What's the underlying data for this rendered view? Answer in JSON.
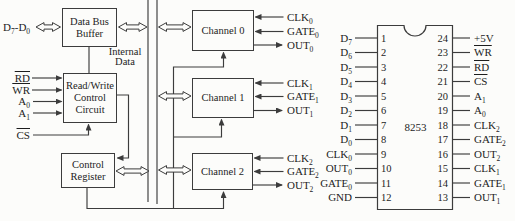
{
  "block_diagram": {
    "data_bus_label": [
      {
        "text": "D",
        "sub": "7"
      },
      {
        "text": "-"
      },
      {
        "text": "D",
        "sub": "0"
      }
    ],
    "control_signals": [
      [
        {
          "text": "RD",
          "overline": true
        }
      ],
      [
        {
          "text": "WR",
          "overline": true
        }
      ],
      [
        {
          "text": "A",
          "sub": "0"
        }
      ],
      [
        {
          "text": "A",
          "sub": "1"
        }
      ]
    ],
    "chip_select": [
      {
        "text": "CS",
        "overline": true
      }
    ],
    "blocks": {
      "data_bus_buffer": "Data Bus Buffer",
      "read_write_control": "Read/Write Control Circuit",
      "control_register": "Control Register"
    },
    "internal_bus_label": "Internal Data",
    "channels": [
      {
        "name": "Channel 0",
        "signals": [
          {
            "dir": "in",
            "label": [
              {
                "text": "CLK",
                "sub": "0"
              }
            ]
          },
          {
            "dir": "in",
            "label": [
              {
                "text": "GATE",
                "sub": "0"
              }
            ]
          },
          {
            "dir": "out",
            "label": [
              {
                "text": "OUT",
                "sub": "0"
              }
            ]
          }
        ]
      },
      {
        "name": "Channel 1",
        "signals": [
          {
            "dir": "in",
            "label": [
              {
                "text": "CLK",
                "sub": "1"
              }
            ]
          },
          {
            "dir": "in",
            "label": [
              {
                "text": "GATE",
                "sub": "1"
              }
            ]
          },
          {
            "dir": "out",
            "label": [
              {
                "text": "OUT",
                "sub": "1"
              }
            ]
          }
        ]
      },
      {
        "name": "Channel 2",
        "signals": [
          {
            "dir": "in",
            "label": [
              {
                "text": "CLK",
                "sub": "2"
              }
            ]
          },
          {
            "dir": "in",
            "label": [
              {
                "text": "GATE",
                "sub": "2"
              }
            ]
          },
          {
            "dir": "out",
            "label": [
              {
                "text": "OUT",
                "sub": "2"
              }
            ]
          }
        ]
      }
    ]
  },
  "pin_diagram": {
    "chip_label": "8253",
    "left_pins": [
      {
        "num": "1",
        "label": [
          {
            "text": "D",
            "sub": "7"
          }
        ]
      },
      {
        "num": "2",
        "label": [
          {
            "text": "D",
            "sub": "6"
          }
        ]
      },
      {
        "num": "3",
        "label": [
          {
            "text": "D",
            "sub": "5"
          }
        ]
      },
      {
        "num": "4",
        "label": [
          {
            "text": "D",
            "sub": "4"
          }
        ]
      },
      {
        "num": "5",
        "label": [
          {
            "text": "D",
            "sub": "3"
          }
        ]
      },
      {
        "num": "6",
        "label": [
          {
            "text": "D",
            "sub": "2"
          }
        ]
      },
      {
        "num": "7",
        "label": [
          {
            "text": "D",
            "sub": "1"
          }
        ]
      },
      {
        "num": "8",
        "label": [
          {
            "text": "D",
            "sub": "0"
          }
        ]
      },
      {
        "num": "9",
        "label": [
          {
            "text": "CLK",
            "sub": "0"
          }
        ]
      },
      {
        "num": "10",
        "label": [
          {
            "text": "OUT",
            "sub": "0"
          }
        ]
      },
      {
        "num": "11",
        "label": [
          {
            "text": "GATE",
            "sub": "0"
          }
        ]
      },
      {
        "num": "12",
        "label": [
          {
            "text": "GND"
          }
        ]
      }
    ],
    "right_pins": [
      {
        "num": "24",
        "label": [
          {
            "text": "+5V"
          }
        ]
      },
      {
        "num": "23",
        "label": [
          {
            "text": "WR",
            "overline": true
          }
        ]
      },
      {
        "num": "22",
        "label": [
          {
            "text": "RD",
            "overline": true
          }
        ]
      },
      {
        "num": "21",
        "label": [
          {
            "text": "CS",
            "overline": true
          }
        ]
      },
      {
        "num": "20",
        "label": [
          {
            "text": "A",
            "sub": "1"
          }
        ]
      },
      {
        "num": "19",
        "label": [
          {
            "text": "A",
            "sub": "0"
          }
        ]
      },
      {
        "num": "18",
        "label": [
          {
            "text": "CLK",
            "sub": "2"
          }
        ]
      },
      {
        "num": "17",
        "label": [
          {
            "text": "GATE",
            "sub": "2"
          }
        ]
      },
      {
        "num": "16",
        "label": [
          {
            "text": "OUT",
            "sub": "2"
          }
        ]
      },
      {
        "num": "15",
        "label": [
          {
            "text": "CLK",
            "sub": "1"
          }
        ]
      },
      {
        "num": "14",
        "label": [
          {
            "text": "GATE",
            "sub": "1"
          }
        ]
      },
      {
        "num": "13",
        "label": [
          {
            "text": "OUT",
            "sub": "1"
          }
        ]
      }
    ]
  },
  "colors": {
    "line": "#3c3c3c",
    "text": "#1d1d1d",
    "background": "#fcfcfa"
  }
}
